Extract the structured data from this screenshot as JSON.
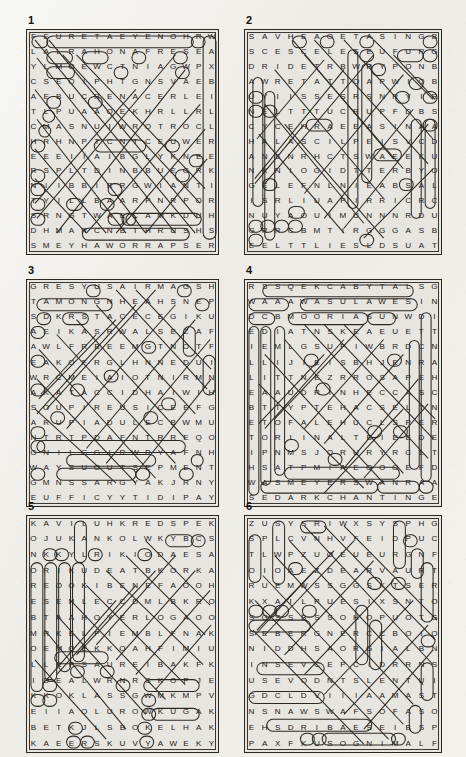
{
  "page": {
    "kind": "word-search-puzzle-sheet",
    "background_color": "#efeeea",
    "ink_color": "#191613",
    "grid_fill_color": "#e7e5df",
    "columns": 2,
    "rows": 3
  },
  "puzzles": [
    {
      "number": "1",
      "size": 15,
      "rows": [
        "FEURETAEYENOHRW",
        "LALRAHONAFRESEA",
        "YLMOEWCTNIAGWPX",
        "CSEOIPHTGNSVAEB",
        "AEBUCRENACERLEI",
        "TLPUAAOEKHRLLRL",
        "CMASNUIWROTROCL",
        "HRHNPTCNTCEUWER",
        "EEEIIAIBGLYKNEE",
        "RSPLTDINBBUEGRK",
        "NIIBBIRRGWIANTI",
        "TYILLBAARPNRPOR",
        "SRNGTWAECAMKDUH",
        "DHMARCNBTHRUSHS",
        "SMEYHAWORRAPSER"
      ]
    },
    {
      "number": "2",
      "size": 15,
      "rows": [
        "SAVHEAOETASINGB",
        "SCESCELESEUFURG",
        "DRIDETRBWRYPONB",
        "AWRETATTOAPWIOB",
        "UYIISSESRSNRYIR",
        "NELTTTUCRUPFDBS",
        "CYCEHRAEEASINAAS",
        "HALASCILPEISVCD",
        "ANSNRHCTSWAEEKU",
        "NKNIOGIDTTERBYO",
        "GELEFNLNIEABSAL",
        "ISRLIUAPIRRICRC",
        "NUYAOUIMUNNNRDU",
        "GRRCBMTIRGGGASB",
        "EELTTLIESLDSUAT"
      ]
    },
    {
      "number": "3",
      "size": 15,
      "rows": [
        "GRESYUSAIRMAGSH",
        "TAMONGNHEAHSNEP",
        "SDKRSTACECEGIKU",
        "AEIKASRWALSEZAF",
        "AWLFRBEEMGTNOTF",
        "EAKOFRGLHNNEDUI",
        "WRCMEIAIOTNIRMN",
        "AKATACCIDHAIWIH",
        "SOUPIREUSICEEFG",
        "ARUPIADULECBWMU",
        "NTRTPDAFNTRREQO",
        "GNILGGIRWRYAFNH",
        "WAYSUOUTSEPMENT",
        "GMNSSARGYAKJRNY",
        "EUFFICYYTIDIPAY"
      ]
    },
    {
      "number": "4",
      "size": 15,
      "rows": [
        "RSSQEKCABYTALSG",
        "WAAAWASULAWESIN",
        "DCBMOORIASUNWDI",
        "EDIATNSKEAEUETT",
        "IEMLGSUPIWBRDCN",
        "LLIJIEISBHJENRA",
        "LITTNEZRROSAPEH",
        "EAAUDRINHECCASC",
        "BTTYPTEHACSELTN",
        "ETOFALEHUCLSPER",
        "TORIINALTBIEEDE",
        "IPNMSJORURYRCLT",
        "HSATPMIAEOOOEFDS",
        "WASMEYERSWANRAA",
        "SEDARKCHANTINGE"
      ]
    },
    {
      "number": "5",
      "size": 15,
      "rows": [
        "KAVILUHKREDSPEK",
        "OJUKANKOLWKYBCS",
        "NKKYLRIKIODAESA",
        "ORIKUDEATBKORKA",
        "REOOKIBENEFAOOH",
        "ESENLECCDMLBKRO",
        "BTAAHOYERLOGAOO",
        "MRKELPIEMBLFNAK",
        "OEMOEKKOAHFIMIU",
        "LLKPSAUREIBAKFK",
        "IDEALWRNRSKOPJE",
        "KKOKLASSGWMKMPV",
        "EIIAOLUROWKUGAK",
        "BETKJLSBOKELHAK",
        "KAEERSKUVYAWEKY"
      ]
    },
    {
      "number": "6",
      "size": 15,
      "rows": [
        "ZUSYSRIWXSYSPHG",
        "SPLCVNHVFEIDPUC",
        "TLWPZUOEUEURGNF",
        "OIOAEZDEARVAURT",
        "RUEMWSSGGSKTSER",
        "KXAILRUESIXSNTO",
        "SGSSBSSOHOPUOTG",
        "SEBERGNERCCBOIO",
        "NIDDHSAORGIALBN",
        "INSEVCEPCIDRRNS",
        "USEVODNTSLENTUI",
        "GDCLDVIIIAAMAST",
        "NSNAWSWAFSOFASO",
        "EHSDRIBAESEIBSP",
        "PAXFKUSOGNIMALF"
      ]
    }
  ]
}
